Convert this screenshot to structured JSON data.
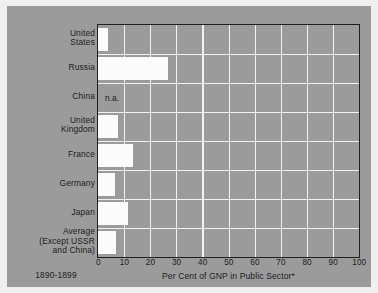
{
  "figure": {
    "period_caption": "1890-1899",
    "panel_color": "#9b9b9b",
    "bar_color": "#fbfbfb",
    "grid_color": "#f2f2f2",
    "axis_color": "#1f1f1f",
    "page_background": "#efefef"
  },
  "chart_data": {
    "type": "bar",
    "orientation": "horizontal",
    "title": "",
    "xlabel": "Per Cent of GNP in Public Sector*",
    "ylabel": "",
    "xlim": [
      0,
      100
    ],
    "xticks": [
      0,
      10,
      20,
      30,
      40,
      50,
      60,
      70,
      80,
      90,
      100
    ],
    "xtick_labels": [
      "0",
      "10",
      "20",
      "30",
      "40",
      "50",
      "60",
      "70",
      "80",
      "90",
      "100"
    ],
    "grid": true,
    "legend": null,
    "categories": [
      "United\nStates",
      "Russia",
      "China",
      "United\nKingdom",
      "France",
      "Germany",
      "Japan",
      "Average\n(Except USSR\nand China)"
    ],
    "values": [
      3.9,
      27.0,
      null,
      7.5,
      13.5,
      6.5,
      11.5,
      7.0
    ],
    "point_labels": [
      "",
      "",
      "n.a.",
      "",
      "",
      "",
      "",
      ""
    ],
    "annotations": [
      "1890-1899"
    ]
  }
}
